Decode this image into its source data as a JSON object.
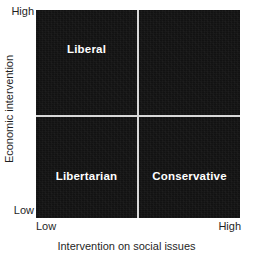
{
  "chart_data": {
    "type": "scatter",
    "title": "",
    "xlabel": "Intervention on social issues",
    "ylabel": "Economic intervention",
    "x_tick_labels": [
      "Low",
      "High"
    ],
    "y_tick_labels": [
      "Low",
      "High"
    ],
    "xlim": [
      "Low",
      "High"
    ],
    "ylim": [
      "Low",
      "High"
    ],
    "grid": false,
    "legend": null,
    "plot_background_color": "#121212",
    "divider_color": "#d9d9d9",
    "label_color": "#ffffff",
    "quadrants": [
      {
        "id": "upper-left",
        "label": "Liberal",
        "x_range": [
          "Low",
          "Mid"
        ],
        "y_range": [
          "Mid",
          "High"
        ]
      },
      {
        "id": "upper-right",
        "label": "",
        "x_range": [
          "Mid",
          "High"
        ],
        "y_range": [
          "Mid",
          "High"
        ]
      },
      {
        "id": "lower-left",
        "label": "Libertarian",
        "x_range": [
          "Low",
          "Mid"
        ],
        "y_range": [
          "Low",
          "Mid"
        ]
      },
      {
        "id": "lower-right",
        "label": "Conservative",
        "x_range": [
          "Mid",
          "High"
        ],
        "y_range": [
          "Low",
          "Mid"
        ]
      }
    ],
    "annotations": [
      "Liberal",
      "Libertarian",
      "Conservative"
    ]
  },
  "axes": {
    "y": {
      "title": "Economic intervention",
      "high_tick": "High",
      "low_tick": "Low"
    },
    "x": {
      "title": "Intervention on social issues",
      "low_tick": "Low",
      "high_tick": "High"
    }
  },
  "quadrant_labels": {
    "upper_left": "Liberal",
    "upper_right": "",
    "lower_left": "Libertarian",
    "lower_right": "Conservative"
  }
}
